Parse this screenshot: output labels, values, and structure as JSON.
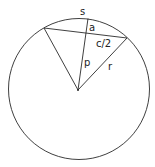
{
  "diagram": {
    "labels": {
      "arc": "s",
      "sagitta": "a",
      "half_chord": "c/2",
      "apothem": "p",
      "radius": "r"
    },
    "colors": {
      "stroke": "#2a2a2a",
      "background": "#ffffff"
    }
  }
}
